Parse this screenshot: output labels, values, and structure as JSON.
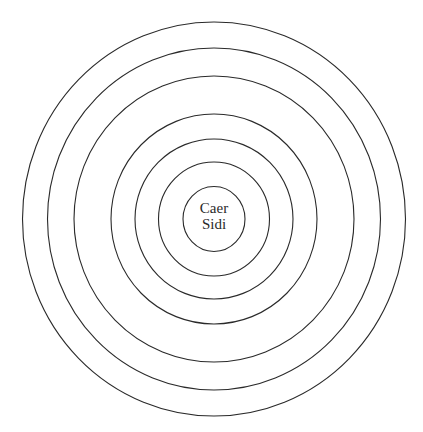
{
  "diagram": {
    "center_label": {
      "line1": "Caer",
      "line2": "Sidi"
    },
    "center": {
      "cx": 214,
      "cy": 219
    },
    "stroke_color": "#2a2a2a",
    "background_color": "#ffffff",
    "rings": [
      {
        "rx": 31,
        "ry": 32.5
      },
      {
        "rx": 55.5,
        "ry": 57
      },
      {
        "rx": 79,
        "ry": 80
      },
      {
        "rx": 103,
        "ry": 105
      },
      {
        "rx": 140,
        "ry": 143
      },
      {
        "rx": 166.5,
        "ry": 171
      },
      {
        "rx": 191.5,
        "ry": 197
      }
    ]
  }
}
